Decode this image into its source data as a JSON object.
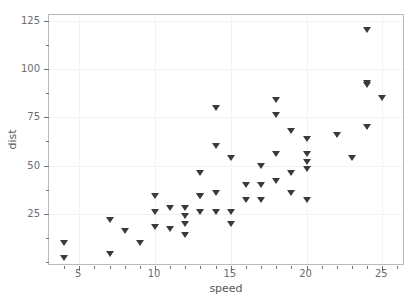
{
  "chart_data": {
    "type": "scatter",
    "title": "",
    "xlabel": "speed",
    "ylabel": "dist",
    "xlim": [
      3.0,
      26.5
    ],
    "ylim": [
      -2.0,
      128.0
    ],
    "grid": true,
    "legend": null,
    "marker": "triangle-down",
    "marker_color": "#3a3a3c",
    "background_color": "#ffffff",
    "frame_color": "#b9bbbe",
    "gridline_color": "#f2f2f4",
    "tick_label_color": "#6b6d70",
    "axis_label_color": "#58595c",
    "xticks": [
      5,
      10,
      15,
      20,
      25
    ],
    "xtick_labels": [
      "5",
      "10",
      "15",
      "20",
      "25"
    ],
    "xticks_minor": [
      4,
      6,
      7,
      8,
      9,
      11,
      12,
      13,
      14,
      16,
      17,
      18,
      19,
      21,
      22,
      23,
      24,
      26
    ],
    "yticks": [
      25,
      50,
      75,
      100,
      125
    ],
    "ytick_labels": [
      "25",
      "50",
      "75",
      "100",
      "125"
    ],
    "yticks_minor": [
      0,
      12.5,
      37.5,
      62.5,
      87.5,
      112.5
    ],
    "n_points": 50,
    "x": [
      4,
      4,
      7,
      7,
      8,
      9,
      10,
      10,
      10,
      11,
      11,
      12,
      12,
      12,
      12,
      13,
      13,
      13,
      13,
      14,
      14,
      14,
      14,
      15,
      15,
      15,
      16,
      16,
      17,
      17,
      17,
      18,
      18,
      18,
      18,
      19,
      19,
      19,
      20,
      20,
      20,
      20,
      20,
      22,
      23,
      24,
      24,
      24,
      24,
      25
    ],
    "y": [
      2,
      10,
      4,
      22,
      16,
      10,
      18,
      26,
      34,
      17,
      28,
      14,
      20,
      24,
      28,
      26,
      34,
      34,
      46,
      26,
      36,
      60,
      80,
      20,
      26,
      54,
      32,
      40,
      32,
      40,
      50,
      42,
      56,
      76,
      84,
      36,
      46,
      68,
      32,
      48,
      52,
      56,
      64,
      66,
      54,
      70,
      92,
      93,
      120,
      85
    ],
    "points": [
      {
        "speed": 4,
        "dist": 2
      },
      {
        "speed": 4,
        "dist": 10
      },
      {
        "speed": 7,
        "dist": 4
      },
      {
        "speed": 7,
        "dist": 22
      },
      {
        "speed": 8,
        "dist": 16
      },
      {
        "speed": 9,
        "dist": 10
      },
      {
        "speed": 10,
        "dist": 18
      },
      {
        "speed": 10,
        "dist": 26
      },
      {
        "speed": 10,
        "dist": 34
      },
      {
        "speed": 11,
        "dist": 17
      },
      {
        "speed": 11,
        "dist": 28
      },
      {
        "speed": 12,
        "dist": 14
      },
      {
        "speed": 12,
        "dist": 20
      },
      {
        "speed": 12,
        "dist": 24
      },
      {
        "speed": 12,
        "dist": 28
      },
      {
        "speed": 13,
        "dist": 26
      },
      {
        "speed": 13,
        "dist": 34
      },
      {
        "speed": 13,
        "dist": 34
      },
      {
        "speed": 13,
        "dist": 46
      },
      {
        "speed": 14,
        "dist": 26
      },
      {
        "speed": 14,
        "dist": 36
      },
      {
        "speed": 14,
        "dist": 60
      },
      {
        "speed": 14,
        "dist": 80
      },
      {
        "speed": 15,
        "dist": 20
      },
      {
        "speed": 15,
        "dist": 26
      },
      {
        "speed": 15,
        "dist": 54
      },
      {
        "speed": 16,
        "dist": 32
      },
      {
        "speed": 16,
        "dist": 40
      },
      {
        "speed": 17,
        "dist": 32
      },
      {
        "speed": 17,
        "dist": 40
      },
      {
        "speed": 17,
        "dist": 50
      },
      {
        "speed": 18,
        "dist": 42
      },
      {
        "speed": 18,
        "dist": 56
      },
      {
        "speed": 18,
        "dist": 76
      },
      {
        "speed": 18,
        "dist": 84
      },
      {
        "speed": 19,
        "dist": 36
      },
      {
        "speed": 19,
        "dist": 46
      },
      {
        "speed": 19,
        "dist": 68
      },
      {
        "speed": 20,
        "dist": 32
      },
      {
        "speed": 20,
        "dist": 48
      },
      {
        "speed": 20,
        "dist": 52
      },
      {
        "speed": 20,
        "dist": 56
      },
      {
        "speed": 20,
        "dist": 64
      },
      {
        "speed": 22,
        "dist": 66
      },
      {
        "speed": 23,
        "dist": 54
      },
      {
        "speed": 24,
        "dist": 70
      },
      {
        "speed": 24,
        "dist": 92
      },
      {
        "speed": 24,
        "dist": 93
      },
      {
        "speed": 24,
        "dist": 120
      },
      {
        "speed": 25,
        "dist": 85
      }
    ]
  }
}
